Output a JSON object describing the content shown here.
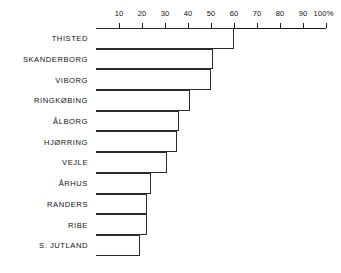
{
  "chart_data": {
    "type": "bar",
    "orientation": "horizontal",
    "title": "",
    "subtitle": "",
    "xlabel": "",
    "ylabel": "",
    "xlim": [
      0,
      100
    ],
    "xunit": "%",
    "grid": false,
    "legend": null,
    "axis_position": "top",
    "tick_labels": [
      "10",
      "20",
      "30",
      "40",
      "50",
      "60",
      "70",
      "80",
      "90",
      "100%"
    ],
    "tick_values": [
      10,
      20,
      30,
      40,
      50,
      60,
      70,
      80,
      90,
      100
    ],
    "categories": [
      "THISTED",
      "SKANDERBORG",
      "VIBORG",
      "RINGKØBING",
      "ÅLBORG",
      "HJØRRING",
      "VEJLE",
      "ÅRHUS",
      "RANDERS",
      "RIBE",
      "S. JUTLAND"
    ],
    "values": [
      60,
      51,
      50,
      41,
      36,
      35,
      31,
      24,
      22,
      22,
      19
    ],
    "bars": [
      {
        "label": "THISTED",
        "value": 60
      },
      {
        "label": "SKANDERBORG",
        "value": 51
      },
      {
        "label": "VIBORG",
        "value": 50
      },
      {
        "label": "RINGKØBING",
        "value": 41
      },
      {
        "label": "ÅLBORG",
        "value": 36
      },
      {
        "label": "HJØRRING",
        "value": 35
      },
      {
        "label": "VEJLE",
        "value": 31
      },
      {
        "label": "ÅRHUS",
        "value": 24
      },
      {
        "label": "RANDERS",
        "value": 22
      },
      {
        "label": "RIBE",
        "value": 22
      },
      {
        "label": "S. JUTLAND",
        "value": 19
      }
    ],
    "colors": {
      "bar_fill": "#ffffff",
      "bar_stroke": "#2b2b2b",
      "axis": "#1a1a1a",
      "text": "#111111",
      "background": "#ffffff"
    }
  }
}
